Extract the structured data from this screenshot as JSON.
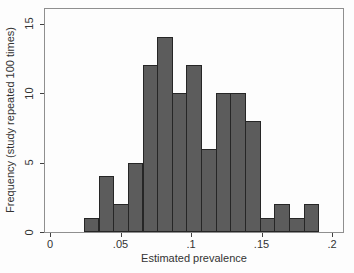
{
  "figure": {
    "background_color": "#fdfdfd",
    "frame_color": "#8f8f8f"
  },
  "chart_data": {
    "type": "bar",
    "subtype": "histogram",
    "title": "",
    "xlabel": "Estimated prevalence",
    "ylabel": "Frequency (study repeated 100 times)",
    "xlim": [
      0,
      0.2
    ],
    "ylim": [
      0,
      15
    ],
    "x_ticks": [
      0,
      0.05,
      0.1,
      0.15,
      0.2
    ],
    "x_tick_labels": [
      "0",
      ".05",
      ".1",
      ".15",
      ".2"
    ],
    "y_ticks": [
      0,
      5,
      10,
      15
    ],
    "y_tick_labels": [
      "0",
      "5",
      "10",
      "15"
    ],
    "grid": "off",
    "legend": "none",
    "bin_start": 0.024,
    "bin_width": 0.0104,
    "frequencies": [
      1,
      4,
      2,
      5,
      12,
      14,
      10,
      12,
      6,
      10,
      10,
      8,
      1,
      2,
      1,
      2
    ],
    "total_count": 100,
    "bar_fill": "#5c5c5c",
    "bar_border": "#262626"
  }
}
